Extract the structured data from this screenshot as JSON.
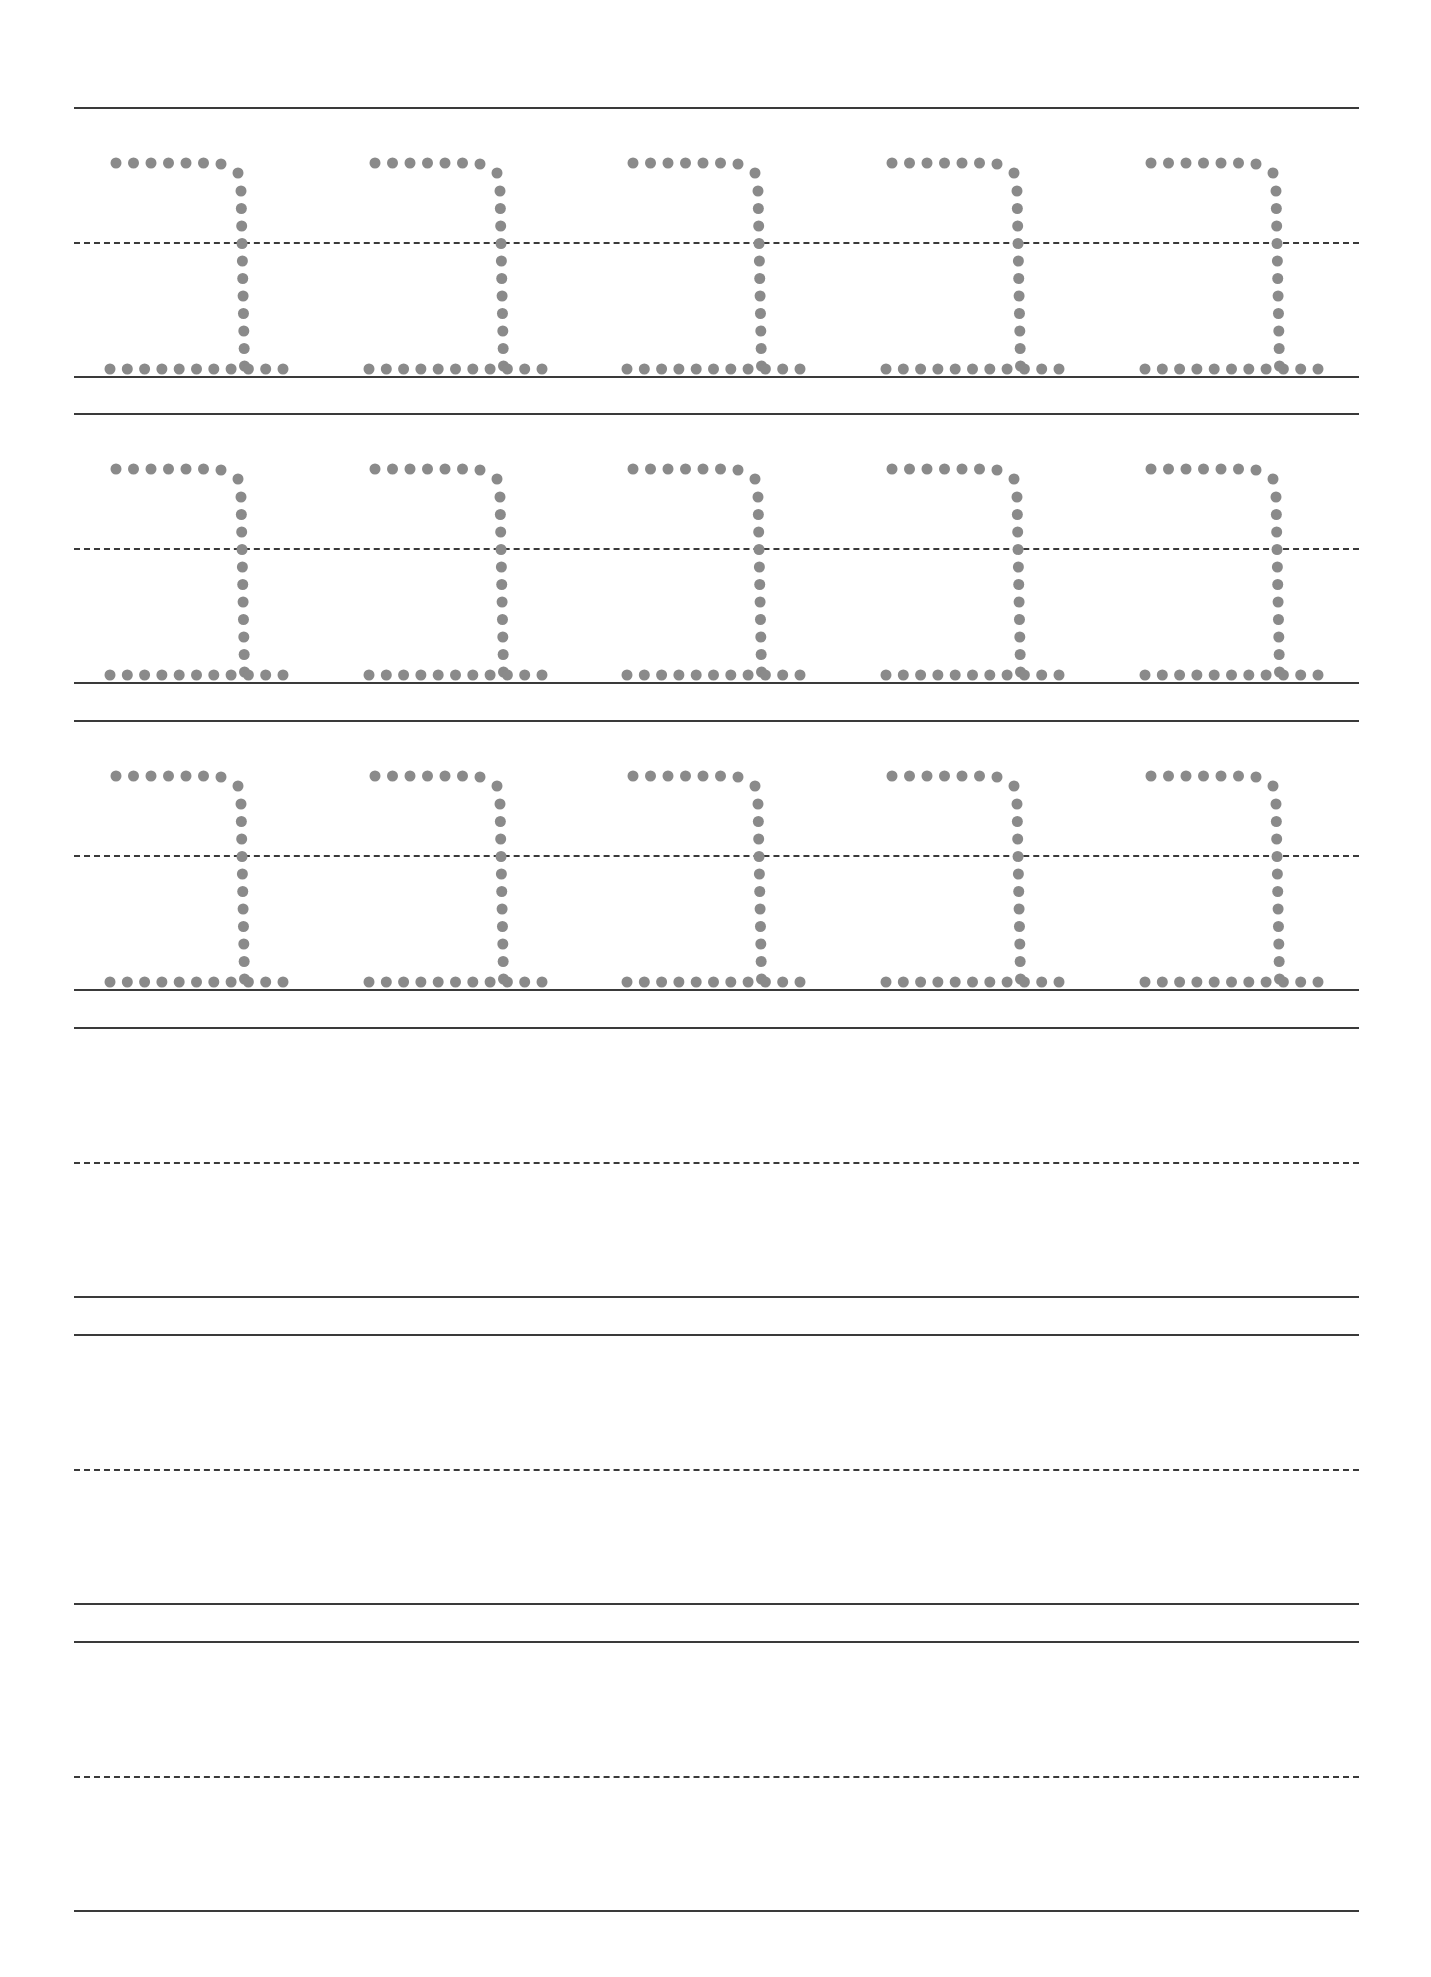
{
  "worksheet": {
    "title": "",
    "letter_glyph": "ㄹ-like hook (tracing glyph)",
    "dot_color": "#8a8a8a",
    "line_color": "#3a3a3a",
    "rows": [
      {
        "index": 1,
        "type": "tracing",
        "letters": 5
      },
      {
        "index": 2,
        "type": "tracing",
        "letters": 5
      },
      {
        "index": 3,
        "type": "tracing",
        "letters": 5
      },
      {
        "index": 4,
        "type": "blank",
        "letters": 0
      },
      {
        "index": 5,
        "type": "blank",
        "letters": 0
      },
      {
        "index": 6,
        "type": "blank",
        "letters": 0
      }
    ]
  }
}
